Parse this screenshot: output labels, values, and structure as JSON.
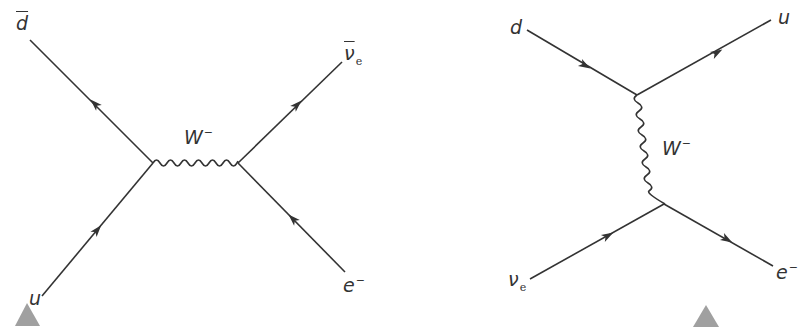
{
  "diagrams": [
    {
      "name": "s-channel",
      "labels": {
        "top_left": "d",
        "top_right": "ν",
        "top_right_sub": "e",
        "bottom_left": "u",
        "bottom_right": "e",
        "bottom_right_sup": "−",
        "boson": "W",
        "boson_sup": "−"
      }
    },
    {
      "name": "t-channel",
      "labels": {
        "top_left": "d",
        "top_right": "u",
        "bottom_left": "ν",
        "bottom_left_sub": "e",
        "bottom_right": "e",
        "bottom_right_sup": "−",
        "boson": "W",
        "boson_sup": "−"
      }
    }
  ],
  "colors": {
    "line": "#333333",
    "marker": "#a0a0a0"
  }
}
